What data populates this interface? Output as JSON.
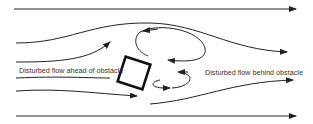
{
  "diagram": {
    "labels": {
      "ahead": "Disturbed flow ahead of obstacle",
      "behind": "Disturbed flow behind obstacle"
    },
    "elements": [
      "streamlines",
      "obstacle (square)",
      "upper vortex",
      "lower vortex"
    ],
    "colors": {
      "line": "#222222",
      "background": "#ffffff"
    }
  }
}
